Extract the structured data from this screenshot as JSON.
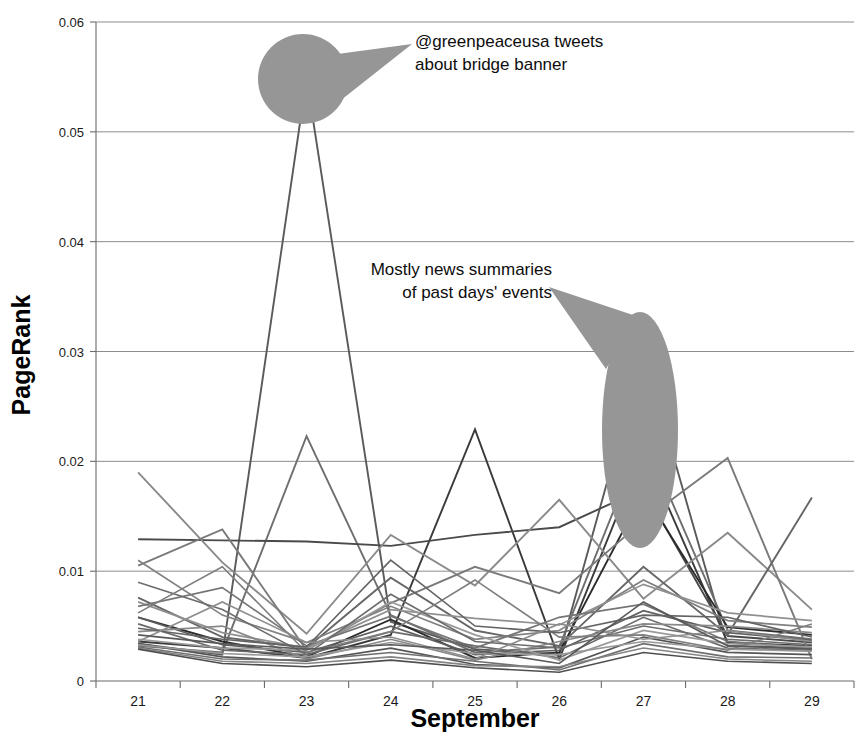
{
  "chart_data": {
    "type": "line",
    "title": "",
    "xlabel": "September",
    "ylabel": "PageRank",
    "categories": [
      "21",
      "22",
      "23",
      "24",
      "25",
      "26",
      "27",
      "28",
      "29"
    ],
    "x": [
      21,
      22,
      23,
      24,
      25,
      26,
      27,
      28,
      29
    ],
    "xlim": [
      20.5,
      29.5
    ],
    "ylim": [
      0,
      0.06
    ],
    "yticks": [
      0,
      0.01,
      0.02,
      0.03,
      0.04,
      0.05,
      0.06
    ],
    "ytick_labels": [
      "0",
      "0.01",
      "0.02",
      "0.03",
      "0.04",
      "0.05",
      "0.06"
    ],
    "xticks": [
      21,
      22,
      23,
      24,
      25,
      26,
      27,
      28,
      29
    ],
    "grid": "horizontal",
    "legend": "none",
    "series": [
      {
        "name": "series-1",
        "color": "#5a5a5a",
        "width": 1.9,
        "values": [
          0.0034,
          0.0024,
          0.0549,
          0.0054,
          0.0029,
          0.0024,
          0.03,
          0.0032,
          0.003
        ]
      },
      {
        "name": "series-2",
        "color": "#6e6e6e",
        "width": 1.9,
        "values": [
          0.0032,
          0.0026,
          0.0223,
          0.006,
          0.0026,
          0.0031,
          0.0223,
          0.0046,
          0.0038
        ]
      },
      {
        "name": "series-3",
        "color": "#3a3a3a",
        "width": 1.9,
        "values": [
          0.0036,
          0.003,
          0.0021,
          0.0042,
          0.0229,
          0.002,
          0.021,
          0.0035,
          0.0032
        ]
      },
      {
        "name": "series-4",
        "color": "#4a4a4a",
        "width": 1.9,
        "values": [
          0.0129,
          0.0128,
          0.0127,
          0.0123,
          0.0133,
          0.014,
          0.0175,
          0.0041,
          0.0035
        ]
      },
      {
        "name": "series-5",
        "color": "#2b2b2b",
        "width": 1.9,
        "values": [
          0.0058,
          0.0036,
          0.0022,
          0.0056,
          0.0021,
          0.0026,
          0.0172,
          0.0049,
          0.0042
        ]
      },
      {
        "name": "series-6",
        "color": "#8a8a8a",
        "width": 1.9,
        "values": [
          0.019,
          0.0108,
          0.0043,
          0.0133,
          0.0087,
          0.0165,
          0.0075,
          0.0135,
          0.0065
        ]
      },
      {
        "name": "series-7",
        "color": "#7a7a7a",
        "width": 1.9,
        "values": [
          0.0105,
          0.0138,
          0.0028,
          0.0071,
          0.0104,
          0.008,
          0.0146,
          0.0203,
          0.002
        ]
      },
      {
        "name": "series-8",
        "color": "#666666",
        "width": 1.9,
        "values": [
          0.0076,
          0.004,
          0.003,
          0.0094,
          0.0046,
          0.0032,
          0.0104,
          0.0042,
          0.0167
        ]
      },
      {
        "name": "series-9",
        "color": "#808080",
        "width": 1.7,
        "values": [
          0.011,
          0.006,
          0.0035,
          0.0068,
          0.0038,
          0.0046,
          0.0092,
          0.0055,
          0.0049
        ]
      },
      {
        "name": "series-10",
        "color": "#909090",
        "width": 1.7,
        "values": [
          0.0072,
          0.0044,
          0.003,
          0.0065,
          0.0057,
          0.0051,
          0.0088,
          0.0062,
          0.0055
        ]
      },
      {
        "name": "series-11",
        "color": "#757575",
        "width": 1.7,
        "values": [
          0.0068,
          0.0085,
          0.0032,
          0.0059,
          0.003,
          0.0058,
          0.007,
          0.0036,
          0.003
        ]
      },
      {
        "name": "series-12",
        "color": "#5f5f5f",
        "width": 1.7,
        "values": [
          0.0058,
          0.0033,
          0.0026,
          0.005,
          0.0024,
          0.0028,
          0.0064,
          0.0044,
          0.0037
        ]
      },
      {
        "name": "series-13",
        "color": "#6a6a6a",
        "width": 1.7,
        "values": [
          0.0052,
          0.0028,
          0.0024,
          0.0045,
          0.0032,
          0.0021,
          0.0058,
          0.003,
          0.0028
        ]
      },
      {
        "name": "series-14",
        "color": "#888888",
        "width": 1.7,
        "values": [
          0.0045,
          0.005,
          0.002,
          0.0038,
          0.0019,
          0.0036,
          0.0052,
          0.005,
          0.0044
        ]
      },
      {
        "name": "series-15",
        "color": "#9a9a9a",
        "width": 1.7,
        "values": [
          0.0038,
          0.003,
          0.0028,
          0.0072,
          0.0042,
          0.0019,
          0.0046,
          0.0034,
          0.0031
        ]
      },
      {
        "name": "series-16",
        "color": "#555555",
        "width": 1.7,
        "values": [
          0.0034,
          0.0022,
          0.0018,
          0.003,
          0.0015,
          0.0012,
          0.004,
          0.0026,
          0.0024
        ]
      },
      {
        "name": "series-17",
        "color": "#707070",
        "width": 1.6,
        "values": [
          0.0031,
          0.002,
          0.0019,
          0.0026,
          0.0018,
          0.001,
          0.0034,
          0.0022,
          0.0021
        ]
      },
      {
        "name": "series-18",
        "color": "#858585",
        "width": 1.6,
        "values": [
          0.003,
          0.0018,
          0.0016,
          0.0022,
          0.0014,
          0.0013,
          0.003,
          0.002,
          0.0018
        ]
      },
      {
        "name": "series-19",
        "color": "#999999",
        "width": 1.6,
        "values": [
          0.0033,
          0.0025,
          0.0022,
          0.0035,
          0.0025,
          0.0024,
          0.0036,
          0.0029,
          0.0027
        ]
      },
      {
        "name": "series-20",
        "color": "#4f4f4f",
        "width": 1.6,
        "values": [
          0.0029,
          0.0016,
          0.0013,
          0.0019,
          0.0012,
          0.0008,
          0.0026,
          0.0018,
          0.0016
        ]
      },
      {
        "name": "series-21",
        "color": "#6c6c6c",
        "width": 1.6,
        "values": [
          0.009,
          0.0065,
          0.0024,
          0.0079,
          0.0036,
          0.003,
          0.005,
          0.0038,
          0.0033
        ]
      },
      {
        "name": "series-22",
        "color": "#7e7e7e",
        "width": 1.6,
        "values": [
          0.0062,
          0.0104,
          0.0026,
          0.0045,
          0.0092,
          0.004,
          0.0042,
          0.0028,
          0.0052
        ]
      },
      {
        "name": "series-23",
        "color": "#636363",
        "width": 1.6,
        "values": [
          0.0048,
          0.0038,
          0.0031,
          0.011,
          0.005,
          0.0044,
          0.006,
          0.0058,
          0.004
        ]
      },
      {
        "name": "series-24",
        "color": "#8e8e8e",
        "width": 1.6,
        "values": [
          0.0036,
          0.0072,
          0.0035,
          0.004,
          0.002,
          0.0052,
          0.0038,
          0.0046,
          0.0036
        ]
      },
      {
        "name": "series-25",
        "color": "#595959",
        "width": 1.6,
        "values": [
          0.0042,
          0.0034,
          0.0029,
          0.0033,
          0.0028,
          0.0016,
          0.0072,
          0.0032,
          0.0029
        ]
      }
    ],
    "annotations": [
      {
        "name": "greenpeace-annotation",
        "lines": [
          "@greenpeaceusa tweets",
          "about bridge banner"
        ],
        "callout_shape": "circle-with-tail",
        "callout_color": "#969696",
        "target_day": 23,
        "target_value": 0.0549
      },
      {
        "name": "news-summaries-annotation",
        "lines": [
          "Mostly news summaries",
          "of past days' events"
        ],
        "callout_shape": "ellipse-with-tail",
        "callout_color": "#969696",
        "target_day": 27,
        "target_value": 0.03
      }
    ]
  }
}
